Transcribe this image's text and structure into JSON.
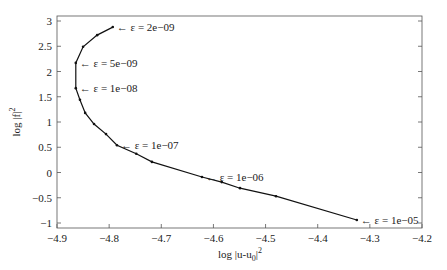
{
  "chart_data": {
    "type": "line",
    "title": "",
    "xlabel": "log |u-u0|^2",
    "xlabel_main": "log |u-u",
    "xlabel_sub": "0",
    "xlabel_tail": "|",
    "xlabel_sup": "2",
    "ylabel": "log |f|^2",
    "ylabel_main": "log |f|",
    "ylabel_sup": "2",
    "xlim": [
      -4.9,
      -4.2
    ],
    "ylim": [
      -1.05,
      3.1
    ],
    "xticks": [
      -4.9,
      -4.8,
      -4.7,
      -4.6,
      -4.5,
      -4.4,
      -4.3,
      -4.2
    ],
    "xtick_labels": [
      "−4.9",
      "−4.8",
      "−4.7",
      "−4.6",
      "−4.5",
      "−4.4",
      "−4.3",
      "−4.2"
    ],
    "yticks": [
      3,
      2.5,
      2,
      1.5,
      1,
      0.5,
      0,
      -0.5,
      -1
    ],
    "ytick_labels": [
      "3",
      "2.5",
      "2",
      "1.5",
      "1",
      "0.5",
      "0",
      "−0.5",
      "−1"
    ],
    "grid": false,
    "legend": null,
    "series": [
      {
        "name": "L-curve",
        "x": [
          -4.793,
          -4.823,
          -4.85,
          -4.864,
          -4.864,
          -4.856,
          -4.846,
          -4.829,
          -4.806,
          -4.785,
          -4.748,
          -4.718,
          -4.622,
          -4.584,
          -4.549,
          -4.48,
          -4.325
        ],
        "y": [
          2.88,
          2.72,
          2.49,
          2.17,
          1.67,
          1.44,
          1.18,
          0.96,
          0.76,
          0.54,
          0.37,
          0.21,
          -0.09,
          -0.19,
          -0.31,
          -0.47,
          -0.94
        ]
      }
    ],
    "annotations": [
      {
        "text": "← ε = 2e−09",
        "x": -4.793,
        "y": 2.88
      },
      {
        "text": "← ε = 5e−09",
        "x": -4.864,
        "y": 2.17
      },
      {
        "text": "← ε = 1e−08",
        "x": -4.864,
        "y": 1.67
      },
      {
        "text": "← ε = 1e−07",
        "x": -4.785,
        "y": 0.54
      },
      {
        "text": "← ε = 1e−06",
        "x": -4.622,
        "y": -0.09
      },
      {
        "text": "← ε = 1e−05",
        "x": -4.325,
        "y": -0.94
      }
    ]
  }
}
